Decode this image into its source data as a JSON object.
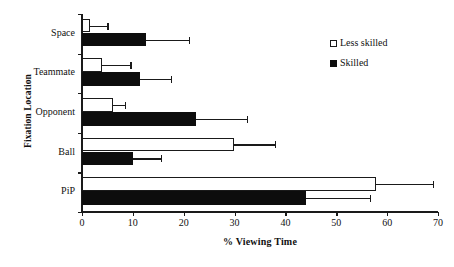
{
  "chart_data": {
    "type": "bar",
    "orientation": "horizontal",
    "title": "",
    "xlabel": "% Viewing Time",
    "ylabel": "Fixation Location",
    "categories": [
      "Space",
      "Teammate",
      "Opponent",
      "Ball",
      "PiP"
    ],
    "xlim": [
      0,
      70
    ],
    "xticks": [
      0,
      10,
      20,
      30,
      40,
      50,
      60,
      70
    ],
    "xtick_labels": [
      "0",
      "10",
      "20",
      "30",
      "40",
      "50",
      "60",
      "70"
    ],
    "grid": false,
    "legend_position": "upper right",
    "series": [
      {
        "name": "Less skilled",
        "color": "#ffffff",
        "edge_color": "#1a1a1a",
        "values": [
          1.5,
          4.0,
          6.0,
          29.8,
          57.8
        ],
        "errors_upper": [
          5.0,
          9.5,
          8.5,
          38.0,
          69.0
        ]
      },
      {
        "name": "Skilled",
        "color": "#0d0d0d",
        "edge_color": "#0d0d0d",
        "values": [
          12.5,
          11.5,
          22.5,
          10.0,
          44.0
        ],
        "errors_upper": [
          21.0,
          17.5,
          32.5,
          15.5,
          56.6
        ]
      }
    ]
  },
  "legend": {
    "items": [
      {
        "label": "Less skilled",
        "swatch": "open-square"
      },
      {
        "label": "Skilled",
        "swatch": "filled-square"
      }
    ]
  },
  "axes": {
    "x_title": "% Viewing Time",
    "y_title": "Fixation Location"
  }
}
